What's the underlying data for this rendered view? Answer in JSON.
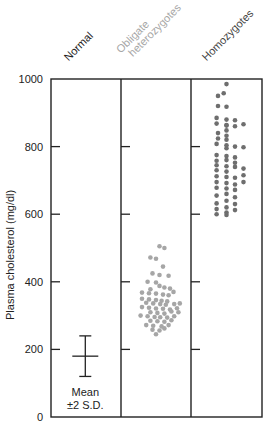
{
  "chart_data": {
    "type": "scatter",
    "title": "",
    "xlabel": "",
    "ylabel": "Plasma cholesterol (mg/dl)",
    "ylim": [
      0,
      1000
    ],
    "yticks": [
      0,
      200,
      400,
      600,
      800,
      1000
    ],
    "grid": false,
    "categories": [
      "Normal",
      "Obligate heterozygotes",
      "Homozygotes"
    ],
    "category_colors": [
      "#222222",
      "#a6a6a6",
      "#6e6e6e"
    ],
    "series": [
      {
        "name": "Normal",
        "kind": "mean_sd",
        "mean": 180,
        "upper": 240,
        "lower": 120,
        "annotation": [
          "Mean",
          "±2 S.D."
        ]
      },
      {
        "name": "Obligate heterozygotes",
        "kind": "dots",
        "color": "#a6a6a6",
        "points": [
          [
            0.55,
            505
          ],
          [
            0.62,
            500
          ],
          [
            0.42,
            472
          ],
          [
            0.5,
            468
          ],
          [
            0.6,
            445
          ],
          [
            0.45,
            425
          ],
          [
            0.55,
            420
          ],
          [
            0.68,
            418
          ],
          [
            0.38,
            400
          ],
          [
            0.5,
            398
          ],
          [
            0.55,
            388
          ],
          [
            0.62,
            383
          ],
          [
            0.7,
            380
          ],
          [
            0.42,
            378
          ],
          [
            0.75,
            370
          ],
          [
            0.3,
            368
          ],
          [
            0.4,
            366
          ],
          [
            0.5,
            365
          ],
          [
            0.6,
            362
          ],
          [
            0.68,
            360
          ],
          [
            0.3,
            350
          ],
          [
            0.4,
            348
          ],
          [
            0.5,
            346
          ],
          [
            0.58,
            344
          ],
          [
            0.66,
            342
          ],
          [
            0.36,
            338
          ],
          [
            0.46,
            336
          ],
          [
            0.56,
            334
          ],
          [
            0.64,
            332
          ],
          [
            0.76,
            334
          ],
          [
            0.84,
            336
          ],
          [
            0.3,
            325
          ],
          [
            0.4,
            323
          ],
          [
            0.5,
            321
          ],
          [
            0.6,
            320
          ],
          [
            0.7,
            318
          ],
          [
            0.8,
            322
          ],
          [
            0.42,
            310
          ],
          [
            0.52,
            308
          ],
          [
            0.62,
            306
          ],
          [
            0.72,
            312
          ],
          [
            0.82,
            310
          ],
          [
            0.28,
            300
          ],
          [
            0.38,
            298
          ],
          [
            0.48,
            296
          ],
          [
            0.56,
            295
          ],
          [
            0.66,
            294
          ],
          [
            0.76,
            298
          ],
          [
            0.42,
            285
          ],
          [
            0.52,
            283
          ],
          [
            0.62,
            282
          ],
          [
            0.72,
            286
          ],
          [
            0.36,
            272
          ],
          [
            0.46,
            270
          ],
          [
            0.58,
            268
          ],
          [
            0.68,
            272
          ],
          [
            0.45,
            258
          ],
          [
            0.55,
            256
          ],
          [
            0.62,
            262
          ],
          [
            0.5,
            245
          ]
        ]
      },
      {
        "name": "Homozygotes",
        "kind": "dots",
        "color": "#6e6e6e",
        "points": [
          [
            0.5,
            985
          ],
          [
            0.38,
            950
          ],
          [
            0.46,
            958
          ],
          [
            0.38,
            920
          ],
          [
            0.5,
            918
          ],
          [
            0.5,
            862
          ],
          [
            0.5,
            848
          ],
          [
            0.38,
            840
          ],
          [
            0.5,
            832
          ],
          [
            0.38,
            824
          ],
          [
            0.5,
            820
          ],
          [
            0.5,
            795
          ],
          [
            0.36,
            775
          ],
          [
            0.5,
            772
          ],
          [
            0.62,
            768
          ],
          [
            0.5,
            760
          ],
          [
            0.36,
            758
          ],
          [
            0.62,
            752
          ],
          [
            0.36,
            745
          ],
          [
            0.5,
            742
          ],
          [
            0.62,
            740
          ],
          [
            0.36,
            730
          ],
          [
            0.5,
            726
          ],
          [
            0.74,
            735
          ],
          [
            0.36,
            712
          ],
          [
            0.5,
            710
          ],
          [
            0.62,
            708
          ],
          [
            0.74,
            715
          ],
          [
            0.36,
            695
          ],
          [
            0.5,
            692
          ],
          [
            0.62,
            688
          ],
          [
            0.74,
            695
          ],
          [
            0.36,
            678
          ],
          [
            0.5,
            676
          ],
          [
            0.62,
            672
          ],
          [
            0.5,
            660
          ],
          [
            0.36,
            655
          ],
          [
            0.62,
            650
          ],
          [
            0.5,
            640
          ],
          [
            0.36,
            632
          ],
          [
            0.62,
            630
          ],
          [
            0.5,
            620
          ],
          [
            0.36,
            615
          ],
          [
            0.5,
            605
          ],
          [
            0.62,
            612
          ],
          [
            0.5,
            598
          ],
          [
            0.36,
            600
          ],
          [
            0.36,
            885
          ],
          [
            0.5,
            880
          ],
          [
            0.62,
            878
          ],
          [
            0.36,
            868
          ],
          [
            0.5,
            864
          ],
          [
            0.62,
            860
          ],
          [
            0.74,
            866
          ],
          [
            0.36,
            808
          ],
          [
            0.5,
            804
          ],
          [
            0.62,
            800
          ],
          [
            0.74,
            798
          ]
        ]
      }
    ],
    "layout": {
      "plot_left": 51,
      "plot_right": 262,
      "plot_top": 79,
      "plot_bottom": 417,
      "dividers": [
        121,
        191
      ],
      "legend": "none"
    }
  }
}
